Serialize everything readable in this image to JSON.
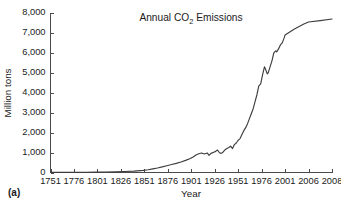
{
  "figure": {
    "panel_label": "(a)"
  },
  "chart_data": {
    "type": "line",
    "title": "Annual CO2 Emissions",
    "title_parts": {
      "before": "Annual CO",
      "subscript": "2",
      "after": " Emissions"
    },
    "xlabel": "Year",
    "ylabel": "Million tons",
    "ylim": [
      0,
      8000
    ],
    "grid": false,
    "legend": "none",
    "line_color": "#3d3d3d",
    "axis_color": "#4a4a4a",
    "background": "#ffffff",
    "yticks": [
      0,
      1000,
      2000,
      3000,
      4000,
      5000,
      6000,
      7000,
      8000
    ],
    "ytick_labels": [
      "0",
      "1,000",
      "2,000",
      "3,000",
      "4,000",
      "5,000",
      "6,000",
      "7,000",
      "8,000"
    ],
    "xticks": [
      1751,
      1776,
      1801,
      1826,
      1851,
      1876,
      1901,
      1926,
      1951,
      1976,
      2001,
      2006,
      2008
    ],
    "xtick_labels": [
      "1751",
      "1776",
      "1801",
      "1826",
      "1851",
      "1876",
      "1901",
      "1926",
      "1951",
      "1976",
      "2001",
      "2006",
      "2008"
    ],
    "x_axis_note": "Tick positions are evenly spaced although the last three intervals (1976-2001, 2001-2006, 2006-2008) span unequal year counts",
    "x": [
      1751,
      1760,
      1770,
      1780,
      1790,
      1800,
      1810,
      1820,
      1830,
      1840,
      1850,
      1855,
      1860,
      1865,
      1870,
      1875,
      1880,
      1885,
      1890,
      1895,
      1900,
      1903,
      1906,
      1909,
      1912,
      1915,
      1918,
      1920,
      1922,
      1925,
      1927,
      1929,
      1931,
      1933,
      1935,
      1937,
      1939,
      1941,
      1943,
      1945,
      1947,
      1949,
      1951,
      1953,
      1955,
      1957,
      1959,
      1961,
      1963,
      1965,
      1967,
      1969,
      1971,
      1973,
      1975,
      1977,
      1979,
      1980,
      1982,
      1983,
      1985,
      1987,
      1989,
      1991,
      1992,
      1994,
      1996,
      1998,
      2000,
      2001,
      2003,
      2005,
      2006,
      2007,
      2008
    ],
    "y": [
      3,
      4,
      6,
      9,
      12,
      18,
      25,
      33,
      48,
      70,
      110,
      140,
      180,
      225,
      280,
      340,
      400,
      460,
      530,
      610,
      700,
      780,
      880,
      940,
      980,
      930,
      980,
      860,
      960,
      1020,
      1060,
      1130,
      990,
      960,
      1030,
      1140,
      1200,
      1250,
      1320,
      1200,
      1400,
      1480,
      1620,
      1700,
      1900,
      2100,
      2250,
      2450,
      2700,
      2950,
      3200,
      3550,
      3900,
      4350,
      4450,
      4900,
      5300,
      5200,
      4950,
      5000,
      5300,
      5600,
      6000,
      6100,
      6050,
      6200,
      6400,
      6500,
      6750,
      6900,
      7200,
      7450,
      7550,
      7620,
      7700
    ],
    "series_note": "Global annual carbon dioxide emissions in million tons, 1751-2008"
  }
}
